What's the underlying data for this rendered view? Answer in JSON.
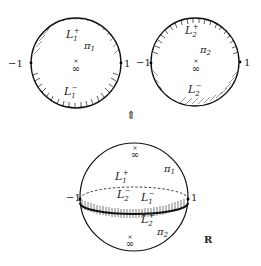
{
  "figure": {
    "left_disc": {
      "upper_label": "L",
      "upper_sub": "1",
      "upper_sup": "+",
      "lower_label": "L",
      "lower_sub": "1",
      "lower_sup": "−",
      "plane_label": "π",
      "plane_sub": "1",
      "infinity": "∞",
      "left_point": "−1",
      "right_point": "1"
    },
    "right_disc": {
      "upper_label": "L",
      "upper_sub": "2",
      "upper_sup": "+",
      "lower_label": "L",
      "lower_sub": "2",
      "lower_sup": "−",
      "plane_label": "π",
      "plane_sub": "2",
      "infinity": "∞",
      "left_point": "−1",
      "right_point": "1"
    },
    "equivalence_arrow": "⇕",
    "sphere": {
      "l1plus": {
        "base": "L",
        "sub": "1",
        "sup": "+"
      },
      "l2minus": {
        "base": "L",
        "sub": "2",
        "sup": "−"
      },
      "l1minus": {
        "base": "L",
        "sub": "1",
        "sup": "−"
      },
      "l2plus": {
        "base": "L",
        "sub": "2",
        "sup": "+"
      },
      "pi1": {
        "base": "π",
        "sub": "1"
      },
      "pi2": {
        "base": "π",
        "sub": "2"
      },
      "infinity_top": "∞",
      "infinity_bottom": "∞",
      "left_point": "−1",
      "right_point": "1",
      "space_label": "R"
    }
  }
}
